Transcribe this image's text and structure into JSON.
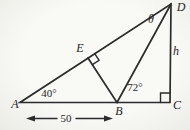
{
  "diagram": {
    "points": {
      "A": {
        "label": "A"
      },
      "B": {
        "label": "B"
      },
      "C": {
        "label": "C"
      },
      "D": {
        "label": "D"
      },
      "E": {
        "label": "E"
      }
    },
    "angles": {
      "at_A": "40°",
      "at_B": "72°",
      "at_D": "θ"
    },
    "measures": {
      "height_CD": "h",
      "base_AB": "50"
    },
    "colors": {
      "line": "#2b2b2b",
      "text": "#1f1f1f",
      "background": "#f6f6f3"
    }
  }
}
